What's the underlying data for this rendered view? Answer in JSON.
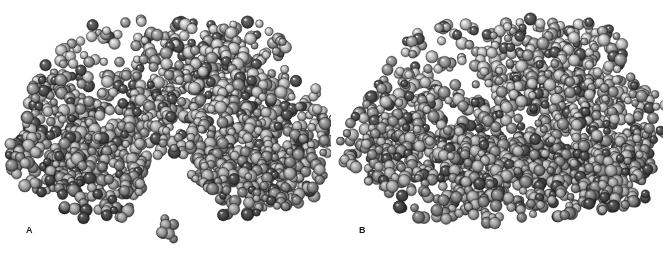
{
  "figure": {
    "width": 663,
    "height": 260,
    "background_color": "#ffffff",
    "figure_type": "space-filling-molecular-model",
    "rendering": "grayscale CPK space-filling spheres, light from upper-left",
    "panel_count": 2
  },
  "palette": {
    "background": "#ffffff",
    "label_color": "#1a1a1a",
    "atom_light_gray": "#d8d8d8",
    "atom_mid_gray": "#9a9a9a",
    "atom_dark_gray": "#4a4a4a",
    "atom_rim": "#2b2b2b",
    "highlight": "#f2f2f2"
  },
  "panels": [
    {
      "id": "panel-a",
      "label": "A",
      "label_x": 26,
      "label_y": 226,
      "conformation": "open",
      "description": "Protein space-filling model in open conformation with deep V-shaped interdomain cleft; separate small ligand cluster below the cleft",
      "origin_x": 0,
      "origin_y": 0,
      "width": 332,
      "height": 260,
      "seed": 20114,
      "atom_count": 1450,
      "sphere_radius_px": 5.0,
      "sphere_radius_jitter": 1.4,
      "blobs": [
        {
          "cx": 118,
          "cy": 78,
          "rx": 86,
          "ry": 58,
          "rot": -10,
          "weight": 1.35
        },
        {
          "cx": 196,
          "cy": 70,
          "rx": 62,
          "ry": 50,
          "rot": 8,
          "weight": 1.05
        },
        {
          "cx": 243,
          "cy": 60,
          "rx": 48,
          "ry": 40,
          "rot": 0,
          "weight": 0.72
        },
        {
          "cx": 86,
          "cy": 128,
          "rx": 66,
          "ry": 52,
          "rot": 18,
          "weight": 1.0
        },
        {
          "cx": 52,
          "cy": 152,
          "rx": 44,
          "ry": 44,
          "rot": 0,
          "weight": 0.82
        },
        {
          "cx": 96,
          "cy": 178,
          "rx": 58,
          "ry": 42,
          "rot": 8,
          "weight": 0.9
        },
        {
          "cx": 139,
          "cy": 150,
          "rx": 38,
          "ry": 44,
          "rot": 0,
          "weight": 0.52
        },
        {
          "cx": 206,
          "cy": 132,
          "rx": 52,
          "ry": 56,
          "rot": -12,
          "weight": 0.92
        },
        {
          "cx": 250,
          "cy": 150,
          "rx": 62,
          "ry": 56,
          "rot": 10,
          "weight": 1.08
        },
        {
          "cx": 288,
          "cy": 128,
          "rx": 48,
          "ry": 50,
          "rot": 0,
          "weight": 0.85
        },
        {
          "cx": 232,
          "cy": 182,
          "rx": 50,
          "ry": 36,
          "rot": 6,
          "weight": 0.7
        },
        {
          "cx": 283,
          "cy": 176,
          "rx": 42,
          "ry": 34,
          "rot": 0,
          "weight": 0.6
        },
        {
          "cx": 170,
          "cy": 227,
          "rx": 14,
          "ry": 17,
          "rot": 0,
          "weight": 0.085
        }
      ],
      "cavities": [
        {
          "cx": 176,
          "cy": 215,
          "rx": 42,
          "ry": 40,
          "rot": 0
        },
        {
          "cx": 168,
          "cy": 186,
          "rx": 24,
          "ry": 34,
          "rot": 0
        },
        {
          "cx": 186,
          "cy": 258,
          "rx": 60,
          "ry": 36,
          "rot": 0
        },
        {
          "cx": 22,
          "cy": 228,
          "rx": 48,
          "ry": 34,
          "rot": 0
        }
      ],
      "ligand": {
        "present": true,
        "label": "bound ligand cluster",
        "cx": 170,
        "cy": 227,
        "rx": 14,
        "ry": 17,
        "atom_count": 11
      }
    },
    {
      "id": "panel-b",
      "label": "B",
      "label_x": 359,
      "label_y": 226,
      "conformation": "closed",
      "description": "Same protein space-filling model in closed conformation; domains have clamped together and the cleft is sealed, ligand engulfed",
      "origin_x": 331,
      "origin_y": 0,
      "width": 332,
      "height": 260,
      "seed": 77302,
      "atom_count": 1470,
      "sphere_radius_px": 5.0,
      "sphere_radius_jitter": 1.4,
      "blobs": [
        {
          "cx": 130,
          "cy": 76,
          "rx": 84,
          "ry": 56,
          "rot": -8,
          "weight": 1.3
        },
        {
          "cx": 205,
          "cy": 66,
          "rx": 62,
          "ry": 48,
          "rot": 6,
          "weight": 1.0
        },
        {
          "cx": 250,
          "cy": 58,
          "rx": 46,
          "ry": 38,
          "rot": 0,
          "weight": 0.68
        },
        {
          "cx": 92,
          "cy": 126,
          "rx": 66,
          "ry": 52,
          "rot": 16,
          "weight": 1.02
        },
        {
          "cx": 50,
          "cy": 148,
          "rx": 42,
          "ry": 42,
          "rot": 0,
          "weight": 0.8
        },
        {
          "cx": 104,
          "cy": 176,
          "rx": 60,
          "ry": 44,
          "rot": 6,
          "weight": 0.95
        },
        {
          "cx": 152,
          "cy": 150,
          "rx": 46,
          "ry": 50,
          "rot": 0,
          "weight": 0.8
        },
        {
          "cx": 172,
          "cy": 186,
          "rx": 44,
          "ry": 40,
          "rot": 0,
          "weight": 0.78
        },
        {
          "cx": 212,
          "cy": 130,
          "rx": 54,
          "ry": 58,
          "rot": -10,
          "weight": 0.95
        },
        {
          "cx": 258,
          "cy": 148,
          "rx": 62,
          "ry": 56,
          "rot": 10,
          "weight": 1.1
        },
        {
          "cx": 294,
          "cy": 126,
          "rx": 46,
          "ry": 50,
          "rot": 0,
          "weight": 0.84
        },
        {
          "cx": 236,
          "cy": 182,
          "rx": 52,
          "ry": 38,
          "rot": 6,
          "weight": 0.78
        },
        {
          "cx": 288,
          "cy": 174,
          "rx": 42,
          "ry": 34,
          "rot": 0,
          "weight": 0.6
        }
      ],
      "cavities": [
        {
          "cx": 186,
          "cy": 256,
          "rx": 64,
          "ry": 32,
          "rot": 0
        },
        {
          "cx": 26,
          "cy": 226,
          "rx": 46,
          "ry": 32,
          "rot": 0
        }
      ],
      "ligand": {
        "present": false,
        "label": "ligand enclosed within closed cleft"
      }
    }
  ]
}
